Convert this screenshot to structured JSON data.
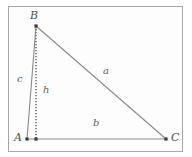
{
  "figure": {
    "type": "geometry-diagram",
    "background_color": "#fdfdfd",
    "frame_color": "#a8a8a8",
    "line_color": "#8a8a8a",
    "dotted_line_color": "#6e6e6e",
    "label_color": "#5a5a5a",
    "vertices": [
      {
        "name": "A",
        "label": "A",
        "x": 27,
        "y": 139,
        "label_x": 14,
        "label_y": 134
      },
      {
        "name": "B",
        "label": "B",
        "x": 36,
        "y": 26,
        "label_x": 30,
        "label_y": 11
      },
      {
        "name": "C",
        "label": "C",
        "x": 166,
        "y": 139,
        "label_x": 171,
        "label_y": 134
      }
    ],
    "foot_of_altitude": {
      "name": "H",
      "x": 36,
      "y": 139
    },
    "edges": [
      {
        "name": "side-c",
        "label": "c",
        "from": "A",
        "to": "B",
        "style": "solid",
        "label_x": 17,
        "label_y": 75
      },
      {
        "name": "side-a",
        "label": "a",
        "from": "B",
        "to": "C",
        "style": "solid",
        "label_x": 103,
        "label_y": 67
      },
      {
        "name": "side-b",
        "label": "b",
        "from": "A",
        "to": "C",
        "style": "solid",
        "label_x": 93,
        "label_y": 119
      },
      {
        "name": "altitude-h",
        "label": "h",
        "from": "B",
        "to": "H",
        "style": "dotted",
        "label_x": 43,
        "label_y": 86
      }
    ]
  }
}
